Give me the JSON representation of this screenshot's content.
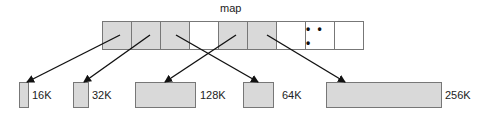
{
  "title": "map",
  "map": {
    "cells": [
      {
        "filled": true,
        "text": ""
      },
      {
        "filled": true,
        "text": ""
      },
      {
        "filled": true,
        "text": ""
      },
      {
        "filled": false,
        "text": ""
      },
      {
        "filled": true,
        "text": ""
      },
      {
        "filled": true,
        "text": ""
      },
      {
        "filled": false,
        "text": ""
      },
      {
        "filled": false,
        "text": "• • •"
      },
      {
        "filled": false,
        "text": ""
      }
    ]
  },
  "blocks": [
    {
      "label": "16K",
      "x": 19,
      "w": 10
    },
    {
      "label": "32K",
      "x": 73,
      "w": 16
    },
    {
      "label": "128K",
      "x": 135,
      "w": 61
    },
    {
      "label": "64K",
      "x": 243,
      "w": 31
    },
    {
      "label": "256K",
      "x": 326,
      "w": 116
    }
  ],
  "colors": {
    "fill": "#d9d9d9",
    "stroke": "#777777",
    "arrow": "#111111"
  }
}
